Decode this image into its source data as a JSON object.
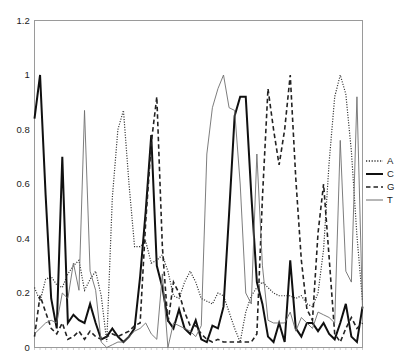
{
  "chart_data": {
    "type": "line",
    "title": "",
    "subtitle": "",
    "xlabel": "",
    "ylabel": "",
    "ylim": [
      0,
      1.2
    ],
    "xlim": [
      0,
      59
    ],
    "yticks": [
      0,
      0.2,
      0.4,
      0.6,
      0.8,
      1,
      1.2
    ],
    "ytick_labels": [
      "0",
      "0.2",
      "0.4",
      "0.6",
      "0.8",
      "1",
      "1.2"
    ],
    "xticks": [],
    "xtick_labels": [],
    "grid": false,
    "legend_position": "right",
    "legend_entries": [
      "A",
      "C",
      "G",
      "T"
    ],
    "x": [
      0,
      1,
      2,
      3,
      4,
      5,
      6,
      7,
      8,
      9,
      10,
      11,
      12,
      13,
      14,
      15,
      16,
      17,
      18,
      19,
      20,
      21,
      22,
      23,
      24,
      25,
      26,
      27,
      28,
      29,
      30,
      31,
      32,
      33,
      34,
      35,
      36,
      37,
      38,
      39,
      40,
      41,
      42,
      43,
      44,
      45,
      46,
      47,
      48,
      49,
      50,
      51,
      52,
      53,
      54,
      55,
      56,
      57,
      58,
      59
    ],
    "series": [
      {
        "name": "A",
        "linestyle": "dotted",
        "color": "#303030",
        "linewidth": 1.2,
        "values": [
          0.22,
          0.17,
          0.25,
          0.26,
          0.23,
          0.22,
          0.27,
          0.3,
          0.32,
          0.21,
          0.25,
          0.28,
          0.19,
          0.02,
          0.55,
          0.8,
          0.87,
          0.6,
          0.37,
          0.37,
          0.39,
          0.31,
          0.32,
          0.34,
          0.28,
          0.19,
          0.18,
          0.24,
          0.28,
          0.24,
          0.18,
          0.17,
          0.16,
          0.2,
          0.19,
          0.13,
          0.07,
          0.02,
          0.13,
          0.19,
          0.22,
          0.24,
          0.22,
          0.2,
          0.19,
          0.19,
          0.19,
          0.18,
          0.19,
          0.16,
          0.15,
          0.2,
          0.36,
          0.68,
          0.92,
          1.0,
          0.93,
          0.72,
          0.41,
          0.17
        ]
      },
      {
        "name": "C",
        "linestyle": "solid",
        "color": "#101010",
        "linewidth": 2.0,
        "values": [
          0.84,
          1.0,
          0.56,
          0.18,
          0.07,
          0.7,
          0.09,
          0.12,
          0.1,
          0.09,
          0.16,
          0.09,
          0.03,
          0.04,
          0.07,
          0.04,
          0.02,
          0.04,
          0.07,
          0.26,
          0.5,
          0.78,
          0.3,
          0.22,
          0.1,
          0.07,
          0.14,
          0.07,
          0.05,
          0.1,
          0.03,
          0.02,
          0.08,
          0.07,
          0.15,
          0.49,
          0.85,
          0.92,
          0.92,
          0.56,
          0.24,
          0.16,
          0.04,
          0.02,
          0.09,
          0.02,
          0.32,
          0.07,
          0.04,
          0.09,
          0.09,
          0.06,
          0.09,
          0.05,
          0.03,
          0.09,
          0.16,
          0.04,
          0.02,
          0.15
        ]
      },
      {
        "name": "G",
        "linestyle": "dashed",
        "color": "#222222",
        "linewidth": 1.6,
        "values": [
          0.04,
          0.19,
          0.13,
          0.07,
          0.05,
          0.09,
          0.03,
          0.04,
          0.06,
          0.03,
          0.06,
          0.04,
          0.03,
          0.04,
          0.05,
          0.04,
          0.05,
          0.06,
          0.08,
          0.09,
          0.46,
          0.75,
          0.92,
          0.37,
          0.09,
          0.24,
          0.2,
          0.13,
          0.08,
          0.08,
          0.05,
          0.03,
          0.02,
          0.03,
          0.02,
          0.02,
          0.02,
          0.02,
          0.02,
          0.02,
          0.05,
          0.55,
          0.95,
          0.8,
          0.67,
          0.8,
          1.0,
          0.62,
          0.32,
          0.14,
          0.1,
          0.42,
          0.6,
          0.33,
          0.05,
          0.02,
          0.07,
          0.11,
          0.07,
          0.09
        ]
      },
      {
        "name": "T",
        "linestyle": "solid",
        "color": "#6e6e6e",
        "linewidth": 0.9,
        "values": [
          0.05,
          0.07,
          0.09,
          0.1,
          0.09,
          0.2,
          0.18,
          0.31,
          0.21,
          0.87,
          0.28,
          0.21,
          0.02,
          0.0,
          0.01,
          0.02,
          0.02,
          0.04,
          0.06,
          0.07,
          0.09,
          0.05,
          0.03,
          0.27,
          0.0,
          0.09,
          0.08,
          0.07,
          0.06,
          0.04,
          0.08,
          0.71,
          0.88,
          0.95,
          1.0,
          0.88,
          0.87,
          0.6,
          0.2,
          0.16,
          0.71,
          0.3,
          0.1,
          0.09,
          0.09,
          0.09,
          0.13,
          0.06,
          0.11,
          0.09,
          0.07,
          0.13,
          0.12,
          0.11,
          0.09,
          0.76,
          0.28,
          0.24,
          0.92,
          0.14
        ]
      }
    ]
  },
  "axes": {
    "border_color": "#9a9a9a",
    "plot_bg": "#ffffff",
    "tick_color": "#9a9a9a"
  }
}
